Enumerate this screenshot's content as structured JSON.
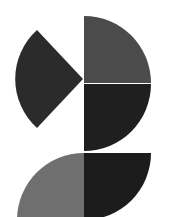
{
  "canvas": {
    "width": 173,
    "height": 217,
    "background": "#ffffff"
  },
  "shapes": {
    "left_wedge": {
      "color": "#2b2b2b"
    },
    "top_right_quarter": {
      "color": "#4b4b4b"
    },
    "middle_right_quarter": {
      "color": "#1f1f1f"
    },
    "bottom_right_quarter": {
      "color": "#1c1c1c"
    },
    "bottom_left_quarter": {
      "color": "#6f6f6f"
    }
  }
}
